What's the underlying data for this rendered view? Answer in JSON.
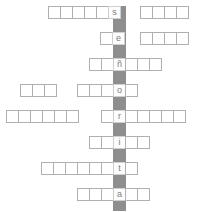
{
  "puzzle": {
    "type": "crossword-acrostic",
    "keyword": "señorita",
    "keyword_letters": [
      "s",
      "e",
      "ñ",
      "o",
      "r",
      "i",
      "t",
      "a"
    ],
    "spine_color": "#8e8e8e",
    "cell_border_color": "#b0b0b0",
    "key_letter_color": "#7d7d7d",
    "background_color": "#ffffff",
    "grid": {
      "cell_size": 13,
      "row_spacing": 26,
      "spine_x": 113
    },
    "rows": [
      {
        "index": 1,
        "letter": "s",
        "y": 6,
        "cells_before": 5,
        "cells_after": 0,
        "left_x": 48,
        "extra_group": {
          "x": 140,
          "cells": 4
        }
      },
      {
        "index": 2,
        "letter": "e",
        "y": 32,
        "cells_before": 1,
        "cells_after": 0,
        "left_x": 100,
        "extra_group": {
          "x": 140,
          "cells": 4
        }
      },
      {
        "index": 3,
        "letter": "ñ",
        "y": 58,
        "cells_before": 2,
        "cells_after": 3,
        "left_x": 89,
        "extra_group": null
      },
      {
        "index": 4,
        "letter": "o",
        "y": 84,
        "cells_before": 3,
        "cells_after": 1,
        "left_x": 77,
        "extra_group": {
          "x": 20,
          "cells": 3
        }
      },
      {
        "index": 5,
        "letter": "r",
        "y": 110,
        "cells_before": 1,
        "cells_after": 5,
        "left_x": 101,
        "extra_group": {
          "x": 6,
          "cells": 6
        }
      },
      {
        "index": 6,
        "letter": "i",
        "y": 136,
        "cells_before": 2,
        "cells_after": 2,
        "left_x": 89,
        "extra_group": null
      },
      {
        "index": 7,
        "letter": "t",
        "y": 162,
        "cells_before": 6,
        "cells_after": 1,
        "left_x": 41,
        "extra_group": null
      },
      {
        "index": 8,
        "letter": "a",
        "y": 188,
        "cells_before": 3,
        "cells_after": 2,
        "left_x": 77,
        "extra_group": null
      }
    ]
  }
}
